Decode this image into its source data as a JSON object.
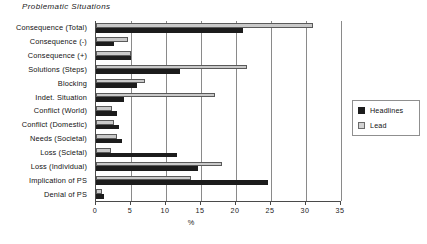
{
  "chart_data": {
    "type": "bar",
    "orientation": "horizontal",
    "title": "Problematic Situations",
    "xlabel": "%",
    "ylabel": "",
    "xlim": [
      0,
      35
    ],
    "xticks": [
      0,
      5,
      10,
      15,
      20,
      25,
      30,
      35
    ],
    "grid": "vertical",
    "legend_position": "right",
    "categories": [
      "Consequence (Total)",
      "Consequence (-)",
      "Consequence (+)",
      "Solutions  (Steps)",
      "Blocking",
      "Indet.  Situation",
      "Conflict  (World)",
      "Conflict  (Domestic)",
      "Needs (Societal)",
      "Loss  (Scietal)",
      "Loss  (Individual)",
      "Implication of PS",
      "Denial of PS"
    ],
    "series": [
      {
        "name": "Lead",
        "color": "#c9c9c9",
        "values": [
          31.0,
          4.5,
          5.0,
          21.5,
          7.0,
          17.0,
          2.3,
          2.6,
          3.0,
          2.2,
          18.0,
          13.5,
          0.8
        ]
      },
      {
        "name": "Headlines",
        "color": "#1c1c1c",
        "values": [
          21.0,
          2.6,
          5.0,
          12.0,
          5.8,
          4.0,
          3.0,
          3.3,
          3.7,
          11.5,
          14.5,
          24.5,
          1.2
        ]
      }
    ]
  },
  "legend": {
    "items": [
      {
        "label": "Headlines",
        "swatch": "headlines"
      },
      {
        "label": "Lead",
        "swatch": "lead"
      }
    ]
  }
}
